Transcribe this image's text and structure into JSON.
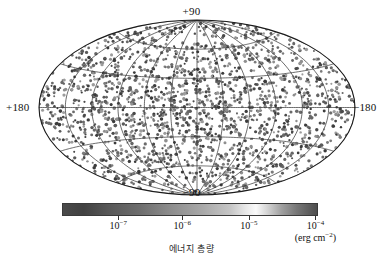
{
  "figure": {
    "projection": "aitoff",
    "background_color": "#ffffff",
    "axis_labels": {
      "top": "+90",
      "bottom": "−90",
      "left": "+180",
      "right": "−180"
    }
  },
  "colorbar": {
    "unit_label_base": "(erg cm",
    "unit_label_exp": "−2",
    "unit_label_close": ")",
    "gradient_stops": [
      {
        "pos": 0,
        "color": "#4a4a4a"
      },
      {
        "pos": 8,
        "color": "#414141"
      },
      {
        "pos": 18,
        "color": "#585858"
      },
      {
        "pos": 30,
        "color": "#6d6d6d"
      },
      {
        "pos": 42,
        "color": "#8c8c8c"
      },
      {
        "pos": 55,
        "color": "#a8a8a8"
      },
      {
        "pos": 66,
        "color": "#c6c6c6"
      },
      {
        "pos": 72,
        "color": "#e8e8e8"
      },
      {
        "pos": 76,
        "color": "#fafafa"
      },
      {
        "pos": 80,
        "color": "#d8d8d8"
      },
      {
        "pos": 86,
        "color": "#a0a0a0"
      },
      {
        "pos": 92,
        "color": "#777777"
      },
      {
        "pos": 100,
        "color": "#4e4e4e"
      }
    ],
    "ticks": [
      {
        "pos_pct": 22,
        "base": "10",
        "exp": "−7"
      },
      {
        "pos_pct": 47,
        "base": "10",
        "exp": "−6"
      },
      {
        "pos_pct": 73,
        "base": "10",
        "exp": "−5"
      },
      {
        "pos_pct": 99,
        "base": "10",
        "exp": "−4"
      }
    ]
  },
  "caption": {
    "text": "에너지 총량"
  },
  "chart_data": {
    "type": "scatter",
    "title": "",
    "xlabel": "",
    "ylabel": "",
    "projection": "aitoff-mollweide all-sky",
    "coordinate_system": "galactic",
    "xlim": [
      180,
      -180
    ],
    "ylim": [
      -90,
      90
    ],
    "grid": true,
    "grid_spacing_longitude_deg": 30,
    "grid_spacing_latitude_deg": 30,
    "legend_position": "below-plot",
    "marker_count": 1900,
    "marker_color_range": [
      "#9a9a9a",
      "#3c3c3c"
    ],
    "colorbar_scale": "log",
    "colorbar_label": "에너지 총량",
    "colorbar_unit": "erg cm^-2",
    "colorbar_tick_values": [
      1e-07,
      1e-06,
      1e-05,
      0.0001
    ],
    "axis_tick_labels": [
      "+90",
      "−90",
      "+180",
      "−180"
    ]
  }
}
